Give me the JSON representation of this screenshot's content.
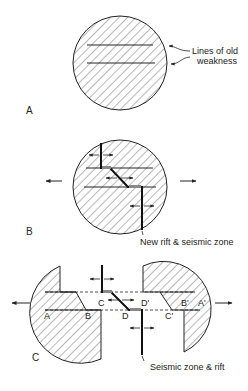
{
  "panels": {
    "a": {
      "label": "A",
      "annotation_line1": "Lines of old",
      "annotation_line2": "weakness"
    },
    "b": {
      "label": "B",
      "annotation": "New rift & seismic zone"
    },
    "c": {
      "label": "C",
      "annotation": "Seismic zone & rift",
      "points": {
        "a": "A",
        "b": "B",
        "c": "C",
        "d": "D",
        "a_prime": "A'",
        "b_prime": "B'",
        "c_prime": "C'",
        "d_prime": "D'"
      }
    }
  },
  "colors": {
    "ink": "#222222",
    "background": "#ffffff"
  }
}
